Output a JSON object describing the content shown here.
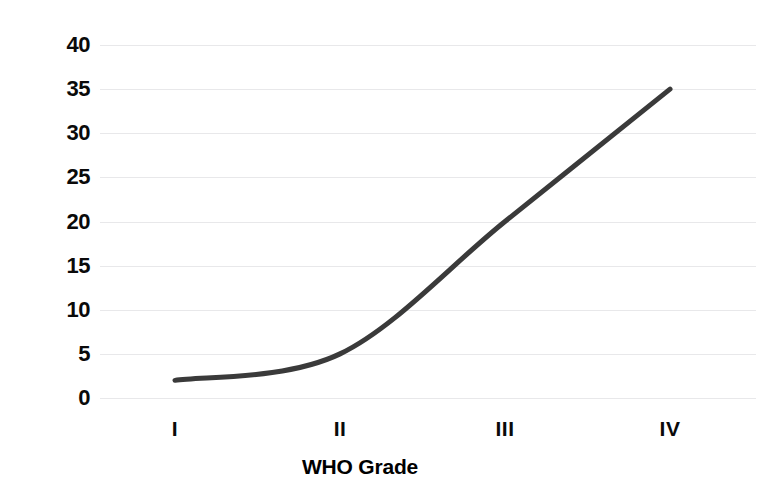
{
  "chart_data": {
    "type": "line",
    "title": "",
    "xlabel": "WHO Grade",
    "ylabel": "Mitotic Count perHPF",
    "categories": [
      "I",
      "II",
      "III",
      "IV"
    ],
    "values": [
      2,
      5,
      20,
      35
    ],
    "series": [
      {
        "name": "Mitotic Count perHPF",
        "values": [
          2,
          5,
          20,
          35
        ],
        "color": "#3a3a3a"
      }
    ],
    "ylim": [
      0,
      40
    ],
    "yticks": [
      0,
      5,
      10,
      15,
      20,
      25,
      30,
      35,
      40
    ],
    "ytick_labels": [
      "0",
      "5",
      "10",
      "15",
      "20",
      "25",
      "30",
      "35",
      "40"
    ],
    "xtick_labels": [
      "I",
      "II",
      "III",
      "IV"
    ],
    "grid": "horizontal",
    "gridline_color": "#e8e8ea",
    "legend": "none",
    "background": "#ffffff",
    "line_width": 5,
    "markers": "none",
    "smoothing": "curved"
  },
  "axes": {
    "y_title": "Mitotic Count perHPF",
    "x_title": "WHO Grade"
  }
}
